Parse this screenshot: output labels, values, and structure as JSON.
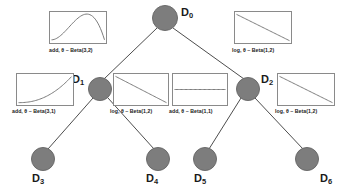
{
  "diagram": {
    "node_color": "#7d7d7d",
    "edge_color": "#4d4d4d",
    "text_color": "#1a1a1a",
    "nodes": [
      {
        "id": "D0",
        "label": "D",
        "sub": "0",
        "cx": 165,
        "cy": 18,
        "r": 13,
        "label_x": 181,
        "label_y": 6
      },
      {
        "id": "D1",
        "label": "D",
        "sub": "1",
        "cx": 100,
        "cy": 89,
        "r": 12,
        "label_x": 72,
        "label_y": 73
      },
      {
        "id": "D2",
        "label": "D",
        "sub": "2",
        "cx": 248,
        "cy": 89,
        "r": 12,
        "label_x": 261,
        "label_y": 73
      },
      {
        "id": "D3",
        "label": "D",
        "sub": "3",
        "cx": 43,
        "cy": 159,
        "r": 12,
        "label_x": 32,
        "label_y": 172
      },
      {
        "id": "D4",
        "label": "D",
        "sub": "4",
        "cx": 158,
        "cy": 159,
        "r": 12,
        "label_x": 146,
        "label_y": 172
      },
      {
        "id": "D5",
        "label": "D",
        "sub": "5",
        "cx": 205,
        "cy": 159,
        "r": 12,
        "label_x": 194,
        "label_y": 172
      },
      {
        "id": "D6",
        "label": "D",
        "sub": "6",
        "cx": 307,
        "cy": 159,
        "r": 12,
        "label_x": 320,
        "label_y": 172
      }
    ],
    "edges": [
      {
        "from": "D0",
        "to": "D1",
        "x1": 157,
        "y1": 28,
        "x2": 104,
        "y2": 79
      },
      {
        "from": "D0",
        "to": "D2",
        "x1": 173,
        "y1": 28,
        "x2": 244,
        "y2": 79
      },
      {
        "from": "D1",
        "to": "D3",
        "x1": 93,
        "y1": 98,
        "x2": 48,
        "y2": 149
      },
      {
        "from": "D1",
        "to": "D4",
        "x1": 108,
        "y1": 98,
        "x2": 154,
        "y2": 149
      },
      {
        "from": "D2",
        "to": "D5",
        "x1": 241,
        "y1": 98,
        "x2": 209,
        "y2": 149
      },
      {
        "from": "D2",
        "to": "D6",
        "x1": 255,
        "y1": 98,
        "x2": 303,
        "y2": 149
      }
    ],
    "thumbnails": [
      {
        "id": "thumb-d0-left",
        "caption": "add, θ ~ Beta(3,2)",
        "curve": "hump",
        "x": 49,
        "y": 11,
        "w": 58,
        "h": 33,
        "caption_x": 49,
        "caption_y": 47
      },
      {
        "id": "thumb-d0-right",
        "caption": "log, θ ~ Beta(1,2)",
        "curve": "diagonal-down",
        "x": 234,
        "y": 11,
        "w": 58,
        "h": 33,
        "caption_x": 232,
        "caption_y": 47
      },
      {
        "id": "thumb-d1-left",
        "caption": "add, θ ~ Beta(3,1)",
        "curve": "convex-up",
        "x": 16,
        "y": 73,
        "w": 58,
        "h": 33,
        "caption_x": 12,
        "caption_y": 108
      },
      {
        "id": "thumb-d1-right",
        "caption": "log, θ ~ Beta(1,2)",
        "curve": "diagonal-down",
        "x": 113,
        "y": 73,
        "w": 56,
        "h": 33,
        "caption_x": 110,
        "caption_y": 108
      },
      {
        "id": "thumb-d2-left",
        "caption": "add, θ ~ Beta(1,1)",
        "curve": "flat",
        "x": 172,
        "y": 73,
        "w": 56,
        "h": 33,
        "caption_x": 169,
        "caption_y": 108
      },
      {
        "id": "thumb-d2-right",
        "caption": "log, θ ~ Beta(1,2)",
        "curve": "diagonal-down",
        "x": 277,
        "y": 73,
        "w": 58,
        "h": 33,
        "caption_x": 275,
        "caption_y": 108
      }
    ]
  },
  "chart_data": {
    "type": "diagram",
    "subtype": "binary-decision-tree",
    "tree": {
      "root": "D0",
      "levels": [
        [
          "D0"
        ],
        [
          "D1",
          "D2"
        ],
        [
          "D3",
          "D4",
          "D5",
          "D6"
        ]
      ],
      "links": [
        {
          "parent": "D0",
          "child": "D1"
        },
        {
          "parent": "D0",
          "child": "D2"
        },
        {
          "parent": "D1",
          "child": "D3"
        },
        {
          "parent": "D1",
          "child": "D4"
        },
        {
          "parent": "D2",
          "child": "D5"
        },
        {
          "parent": "D2",
          "child": "D6"
        }
      ]
    },
    "annotations": [
      {
        "attached_to": "D0",
        "side": "left",
        "transform": "add",
        "prior": "Beta(3,2)",
        "text": "add, θ ~ Beta(3,2)",
        "shape": "unimodal hump peaking near x=0.55"
      },
      {
        "attached_to": "D0",
        "side": "right",
        "transform": "log",
        "prior": "Beta(1,2)",
        "text": "log, θ ~ Beta(1,2)",
        "shape": "monotone decreasing straight line"
      },
      {
        "attached_to": "D1",
        "side": "left",
        "transform": "add",
        "prior": "Beta(3,1)",
        "text": "add, θ ~ Beta(3,1)",
        "shape": "convex increasing curve"
      },
      {
        "attached_to": "D1",
        "side": "right",
        "transform": "log",
        "prior": "Beta(1,2)",
        "text": "log, θ ~ Beta(1,2)",
        "shape": "monotone decreasing straight line"
      },
      {
        "attached_to": "D2",
        "side": "left",
        "transform": "add",
        "prior": "Beta(1,1)",
        "text": "add, θ ~ Beta(1,1)",
        "shape": "flat horizontal line (uniform)"
      },
      {
        "attached_to": "D2",
        "side": "right",
        "transform": "log",
        "prior": "Beta(1,2)",
        "text": "log, θ ~ Beta(1,2)",
        "shape": "monotone decreasing straight line"
      }
    ],
    "node_labels": [
      "D0",
      "D1",
      "D2",
      "D3",
      "D4",
      "D5",
      "D6"
    ],
    "xlabel": "",
    "ylabel": "",
    "grid": false,
    "legend": null
  }
}
